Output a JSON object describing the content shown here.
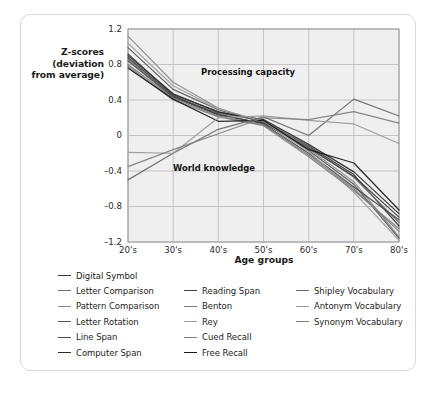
{
  "chart_data": {
    "type": "line",
    "title": "",
    "xlabel": "Age groups",
    "ylabel": "Z-scores (deviation from average)",
    "ylabel_lines": [
      "Z-scores",
      "(deviation",
      "from average)"
    ],
    "categories": [
      "20's",
      "30's",
      "40's",
      "50's",
      "60's",
      "70's",
      "80's"
    ],
    "ylim": [
      -1.2,
      1.2
    ],
    "yticks": [
      1.2,
      0.8,
      0.4,
      0,
      -0.4,
      -0.8,
      -1.2
    ],
    "ytick_labels": [
      "1.2",
      "0.8",
      "0.4",
      "0",
      "–0.4",
      "–0.8",
      "–1.2"
    ],
    "grid": true,
    "legend_position": "below-plot",
    "annotations": [
      {
        "text": "Processing capacity",
        "x": "45's",
        "y": 0.63
      },
      {
        "text": "World knowledge",
        "x": "42's",
        "y": -0.35
      }
    ],
    "series": [
      {
        "name": "Digital Symbol",
        "color": "#3a3a3a",
        "values": [
          0.92,
          0.46,
          0.27,
          0.16,
          -0.12,
          -0.44,
          -1.02
        ]
      },
      {
        "name": "Letter Comparison",
        "color": "#6e6e6e",
        "values": [
          0.86,
          0.44,
          0.25,
          0.17,
          -0.13,
          -0.47,
          -0.98
        ]
      },
      {
        "name": "Pattern Comparison",
        "color": "#8c8c8c",
        "values": [
          1.12,
          0.6,
          0.31,
          0.14,
          -0.15,
          -0.52,
          -1.14
        ]
      },
      {
        "name": "Letter Rotation",
        "color": "#575757",
        "values": [
          0.99,
          0.52,
          0.29,
          0.15,
          -0.17,
          -0.55,
          -1.16
        ]
      },
      {
        "name": "Line Span",
        "color": "#4a4a4a",
        "values": [
          0.84,
          0.43,
          0.24,
          0.13,
          -0.2,
          -0.58,
          -0.95
        ]
      },
      {
        "name": "Computer Span",
        "color": "#2b2b2b",
        "values": [
          0.9,
          0.47,
          0.26,
          0.18,
          -0.1,
          -0.41,
          -0.88
        ]
      },
      {
        "name": "Reading Span",
        "color": "#3f3f3f",
        "values": [
          0.88,
          0.45,
          0.23,
          0.14,
          -0.14,
          -0.46,
          -0.92
        ]
      },
      {
        "name": "Benton",
        "color": "#7a7a7a",
        "values": [
          0.8,
          0.42,
          0.22,
          0.12,
          -0.22,
          -0.6,
          -1.08
        ]
      },
      {
        "name": "Rey",
        "color": "#a0a0a0",
        "values": [
          1.04,
          0.56,
          0.3,
          0.16,
          -0.18,
          -0.64,
          -1.18
        ]
      },
      {
        "name": "Cued Recall",
        "color": "#808080",
        "values": [
          0.78,
          0.4,
          0.21,
          0.11,
          -0.24,
          -0.62,
          -1.05
        ]
      },
      {
        "name": "Free Recall",
        "color": "#1a1a1a",
        "values": [
          0.76,
          0.41,
          0.16,
          0.17,
          -0.16,
          -0.31,
          -0.84
        ]
      },
      {
        "name": "Shipley Vocabulary",
        "color": "#6a6a6a",
        "values": [
          -0.5,
          -0.2,
          0.07,
          0.21,
          0.0,
          0.41,
          0.22
        ]
      },
      {
        "name": "Antonym Vocabulary",
        "color": "#9a9a9a",
        "values": [
          -0.19,
          -0.2,
          0.2,
          0.22,
          0.17,
          0.13,
          -0.09
        ]
      },
      {
        "name": "Synonym Vocabulary",
        "color": "#7f7f7f",
        "values": [
          -0.35,
          -0.16,
          0.02,
          0.2,
          0.18,
          0.27,
          0.14
        ]
      }
    ]
  },
  "legend": {
    "columns": [
      {
        "items": [
          {
            "label": "Digital Symbol",
            "color": "#3a3a3a"
          },
          {
            "label": "Letter Comparison",
            "color": "#6e6e6e"
          },
          {
            "label": "Pattern Comparison",
            "color": "#8c8c8c"
          },
          {
            "label": "Letter Rotation",
            "color": "#575757"
          },
          {
            "label": "Line Span",
            "color": "#4a4a4a"
          },
          {
            "label": "Computer Span",
            "color": "#2b2b2b"
          }
        ]
      },
      {
        "items": [
          {
            "label": "Reading Span",
            "color": "#3f3f3f"
          },
          {
            "label": "Benton",
            "color": "#7a7a7a"
          },
          {
            "label": "Rey",
            "color": "#a0a0a0"
          },
          {
            "label": "Cued Recall",
            "color": "#808080"
          },
          {
            "label": "Free Recall",
            "color": "#1a1a1a"
          }
        ]
      },
      {
        "items": [
          {
            "label": "Shipley Vocabulary",
            "color": "#6a6a6a"
          },
          {
            "label": "Antonym Vocabulary",
            "color": "#9a9a9a"
          },
          {
            "label": "Synonym Vocabulary",
            "color": "#7f7f7f"
          }
        ]
      }
    ]
  },
  "style": {
    "plot_background": "#efefef",
    "grid_color": "#b9b9b9",
    "plot_border": "#9e9e9e",
    "card_border": "#d8d8d8",
    "text_color": "#1b1b1b"
  }
}
